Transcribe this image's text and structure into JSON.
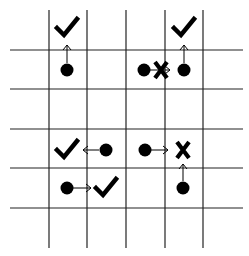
{
  "diagram": {
    "type": "grid-movement",
    "colors": {
      "background": "#ffffff",
      "line": "#222222",
      "ink": "#000000"
    },
    "grid": {
      "vertical_lines_x": [
        49,
        87,
        126,
        165,
        203
      ],
      "vertical_extent_y": [
        10,
        248
      ],
      "horizontal_lines_y": [
        50,
        89,
        129,
        168,
        208
      ],
      "horizontal_extent_x": [
        10,
        243
      ]
    },
    "pieces": [
      {
        "id": "dot-1",
        "kind": "dot",
        "x": 67,
        "y": 70
      },
      {
        "id": "check-1",
        "kind": "check",
        "x": 67,
        "y": 28
      },
      {
        "id": "dot-2",
        "kind": "dot",
        "x": 184,
        "y": 70
      },
      {
        "id": "check-2",
        "kind": "check",
        "x": 184,
        "y": 28
      },
      {
        "id": "dot-3",
        "kind": "dot",
        "x": 144,
        "y": 70
      },
      {
        "id": "cross-1",
        "kind": "cross",
        "x": 161,
        "y": 70
      },
      {
        "id": "dot-4",
        "kind": "dot",
        "x": 106,
        "y": 150
      },
      {
        "id": "check-3",
        "kind": "check",
        "x": 67,
        "y": 150
      },
      {
        "id": "dot-5",
        "kind": "dot",
        "x": 145,
        "y": 150
      },
      {
        "id": "cross-2",
        "kind": "cross",
        "x": 183,
        "y": 150
      },
      {
        "id": "dot-6",
        "kind": "dot",
        "x": 67,
        "y": 188
      },
      {
        "id": "check-4",
        "kind": "check",
        "x": 106,
        "y": 188
      },
      {
        "id": "dot-7",
        "kind": "dot",
        "x": 183,
        "y": 188
      }
    ],
    "arrows": [
      {
        "id": "arrow-1",
        "direction": "up",
        "x1": 67,
        "y1": 63,
        "x2": 67,
        "y2": 45
      },
      {
        "id": "arrow-2",
        "direction": "up",
        "x1": 184,
        "y1": 63,
        "x2": 184,
        "y2": 45
      },
      {
        "id": "arrow-3",
        "direction": "right",
        "x1": 150,
        "y1": 70,
        "x2": 170,
        "y2": 70
      },
      {
        "id": "arrow-4",
        "direction": "left",
        "x1": 99,
        "y1": 150,
        "x2": 83,
        "y2": 150
      },
      {
        "id": "arrow-5",
        "direction": "right",
        "x1": 151,
        "y1": 150,
        "x2": 168,
        "y2": 150
      },
      {
        "id": "arrow-6",
        "direction": "right",
        "x1": 73,
        "y1": 188,
        "x2": 91,
        "y2": 188
      },
      {
        "id": "arrow-7",
        "direction": "up",
        "x1": 183,
        "y1": 181,
        "x2": 183,
        "y2": 164
      }
    ]
  }
}
